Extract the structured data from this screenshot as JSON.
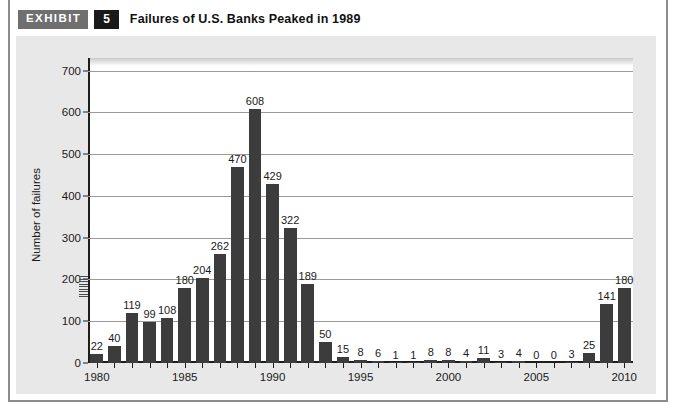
{
  "header": {
    "exhibit_label": "EXHIBIT",
    "exhibit_number": "5",
    "title": "Failures of U.S. Banks Peaked in 1989"
  },
  "colors": {
    "bar": "#3c3c3c",
    "plot_background": "#ffffff",
    "frame_background": "#e8e8e8",
    "axis": "#1d1d1d",
    "gridline": "#9a9a9a",
    "exhibit_tag_background": "#6f6f6f",
    "exhibit_number_background": "#1a1a1a"
  },
  "chart_data": {
    "type": "bar",
    "title": "Failures of U.S. Banks Peaked in 1989",
    "xlabel": "",
    "ylabel": "Number of failures",
    "ylim": [
      0,
      730
    ],
    "yticks": [
      0,
      100,
      200,
      300,
      400,
      500,
      600,
      700
    ],
    "ytick_labels": [
      "0",
      "100",
      "200",
      "300",
      "400",
      "500",
      "600",
      "700"
    ],
    "xlim": [
      1979.5,
      2010.5
    ],
    "xticks": [
      1980,
      1985,
      1990,
      1995,
      2000,
      2005,
      2010
    ],
    "xtick_labels": [
      "1980",
      "1985",
      "1990",
      "1995",
      "2000",
      "2005",
      "2010"
    ],
    "grid": true,
    "legend": null,
    "categories": [
      "1980",
      "1981",
      "1982",
      "1983",
      "1984",
      "1986",
      "1986",
      "1987",
      "1988",
      "1989",
      "1990",
      "1991",
      "1992",
      "1993",
      "1994",
      "1995",
      "1996",
      "1997",
      "1998",
      "1999",
      "2000",
      "2001",
      "2002",
      "2003",
      "2004",
      "2005",
      "2006",
      "2007",
      "2008",
      "2009",
      "2010"
    ],
    "values": [
      22,
      40,
      119,
      99,
      108,
      180,
      204,
      262,
      470,
      608,
      429,
      322,
      189,
      50,
      15,
      8,
      6,
      1,
      1,
      8,
      8,
      4,
      11,
      3,
      4,
      0,
      0,
      3,
      25,
      141,
      180
    ],
    "data_labels": [
      "22",
      "40",
      "119",
      "99",
      "108",
      "180",
      "204",
      "262",
      "470",
      "608",
      "429",
      "322",
      "189",
      "50",
      "15",
      "8",
      "6",
      "1",
      "1",
      "8",
      "8",
      "4",
      "11",
      "3",
      "4",
      "0",
      "0",
      "3",
      "25",
      "141",
      "180"
    ],
    "points": [
      {
        "year": 1980,
        "value": 22
      },
      {
        "year": 1981,
        "value": 40
      },
      {
        "year": 1982,
        "value": 119
      },
      {
        "year": 1983,
        "value": 99
      },
      {
        "year": 1984,
        "value": 108
      },
      {
        "year": 1985,
        "value": 180
      },
      {
        "year": 1986,
        "value": 204
      },
      {
        "year": 1987,
        "value": 262
      },
      {
        "year": 1988,
        "value": 470
      },
      {
        "year": 1989,
        "value": 608
      },
      {
        "year": 1990,
        "value": 429
      },
      {
        "year": 1991,
        "value": 322
      },
      {
        "year": 1992,
        "value": 189
      },
      {
        "year": 1993,
        "value": 50
      },
      {
        "year": 1994,
        "value": 15
      },
      {
        "year": 1995,
        "value": 8
      },
      {
        "year": 1996,
        "value": 6
      },
      {
        "year": 1997,
        "value": 1
      },
      {
        "year": 1998,
        "value": 1
      },
      {
        "year": 1999,
        "value": 8
      },
      {
        "year": 2000,
        "value": 8
      },
      {
        "year": 2001,
        "value": 4
      },
      {
        "year": 2002,
        "value": 11
      },
      {
        "year": 2003,
        "value": 3
      },
      {
        "year": 2004,
        "value": 4
      },
      {
        "year": 2005,
        "value": 0
      },
      {
        "year": 2006,
        "value": 0
      },
      {
        "year": 2007,
        "value": 3
      },
      {
        "year": 2008,
        "value": 25
      },
      {
        "year": 2009,
        "value": 141
      },
      {
        "year": 2010,
        "value": 180
      }
    ]
  }
}
